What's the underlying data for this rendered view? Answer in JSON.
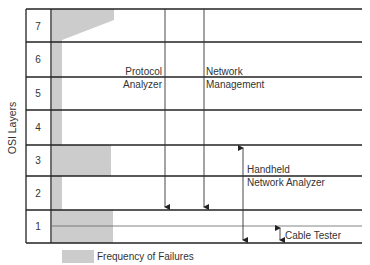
{
  "diagram": {
    "axis_label": "OSI Layers",
    "layers": [
      {
        "number": "7",
        "top": 9,
        "bottom": 42
      },
      {
        "number": "6",
        "top": 42,
        "bottom": 77
      },
      {
        "number": "5",
        "top": 77,
        "bottom": 110
      },
      {
        "number": "4",
        "top": 110,
        "bottom": 145
      },
      {
        "number": "3",
        "top": 145,
        "bottom": 176
      },
      {
        "number": "2",
        "top": 176,
        "bottom": 210
      },
      {
        "number": "1",
        "top": 210,
        "bottom": 243
      }
    ],
    "tools": [
      {
        "name": "protocol-analyzer",
        "label_line1": "Protocol",
        "label_line2": "Analyzer",
        "span": "Layers 7 to 2"
      },
      {
        "name": "network-management",
        "label_line1": "Network",
        "label_line2": "Management",
        "span": "Layers 7 to 2"
      },
      {
        "name": "handheld-network-analyzer",
        "label_line1": "Handheld",
        "label_line2": "Network Analyzer",
        "span": "Layers 3 to 1"
      },
      {
        "name": "cable-tester",
        "label_line1": "Cable Tester",
        "span": "Layer 1 (physical)"
      }
    ],
    "legend": {
      "label": "Frequency of Failures",
      "color": "#cccccc"
    },
    "colors": {
      "line": "#222222",
      "fill": "#cccccc"
    }
  }
}
